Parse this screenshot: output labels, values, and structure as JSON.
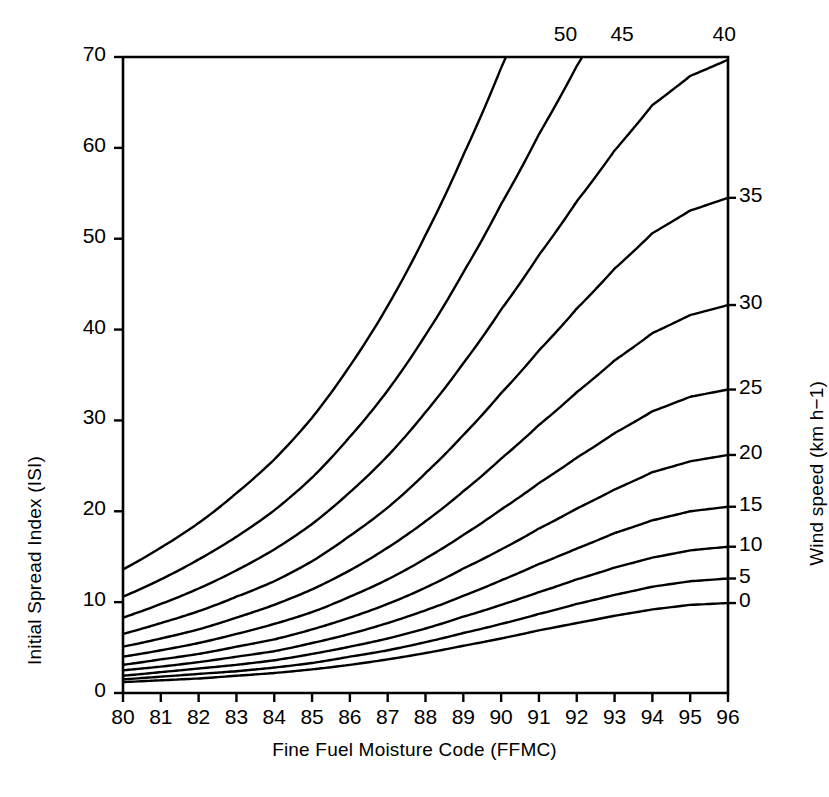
{
  "chart_data": {
    "type": "line",
    "title": "",
    "xlabel": "Fine Fuel Moisture Code (FFMC)",
    "ylabel": "Initial Spread Index (ISI)",
    "y2label": "Wind speed (km h−1)",
    "xlim": [
      80,
      96
    ],
    "ylim": [
      0,
      70
    ],
    "grid": false,
    "legend_position": "curve-end-labels",
    "xticks": [
      "80",
      "81",
      "82",
      "83",
      "84",
      "85",
      "86",
      "87",
      "88",
      "89",
      "90",
      "91",
      "92",
      "93",
      "94",
      "95",
      "96"
    ],
    "xtick_values": [
      80,
      81,
      82,
      83,
      84,
      85,
      86,
      87,
      88,
      89,
      90,
      91,
      92,
      93,
      94,
      95,
      96
    ],
    "yticks": [
      "0",
      "10",
      "20",
      "30",
      "40",
      "50",
      "60",
      "70"
    ],
    "ytick_values": [
      0,
      10,
      20,
      30,
      40,
      50,
      60,
      70
    ],
    "y2_labels_right": [
      "35",
      "30",
      "25",
      "20",
      "15",
      "10",
      "5",
      "0"
    ],
    "y2_labels_top": [
      "50",
      "45",
      "40"
    ],
    "series_label_unit": "km h−1",
    "x": [
      80,
      81,
      82,
      83,
      84,
      85,
      86,
      87,
      88,
      89,
      90,
      91,
      92,
      93,
      94,
      95,
      96
    ],
    "series": [
      {
        "name": "0",
        "wind": 0,
        "values": [
          1.2,
          1.4,
          1.6,
          1.9,
          2.2,
          2.6,
          3.1,
          3.7,
          4.4,
          5.2,
          6.0,
          6.9,
          7.7,
          8.5,
          9.2,
          9.7,
          9.9
        ]
      },
      {
        "name": "5",
        "wind": 5,
        "values": [
          1.5,
          1.8,
          2.1,
          2.4,
          2.8,
          3.3,
          4.0,
          4.7,
          5.6,
          6.6,
          7.6,
          8.7,
          9.8,
          10.8,
          11.7,
          12.3,
          12.6
        ]
      },
      {
        "name": "10",
        "wind": 10,
        "values": [
          1.9,
          2.3,
          2.7,
          3.1,
          3.6,
          4.3,
          5.1,
          6.0,
          7.1,
          8.4,
          9.7,
          11.1,
          12.5,
          13.8,
          14.9,
          15.7,
          16.1
        ]
      },
      {
        "name": "15",
        "wind": 15,
        "values": [
          2.5,
          2.9,
          3.4,
          4.0,
          4.6,
          5.5,
          6.5,
          7.7,
          9.1,
          10.7,
          12.4,
          14.2,
          15.9,
          17.6,
          19.0,
          20.0,
          20.5
        ]
      },
      {
        "name": "20",
        "wind": 20,
        "values": [
          3.1,
          3.7,
          4.3,
          5.1,
          5.9,
          7.0,
          8.3,
          9.8,
          11.6,
          13.7,
          15.8,
          18.1,
          20.3,
          22.4,
          24.3,
          25.5,
          26.2
        ]
      },
      {
        "name": "25",
        "wind": 25,
        "values": [
          4.0,
          4.7,
          5.5,
          6.5,
          7.6,
          8.9,
          10.6,
          12.5,
          14.8,
          17.4,
          20.2,
          23.1,
          25.9,
          28.6,
          31.0,
          32.6,
          33.4
        ]
      },
      {
        "name": "30",
        "wind": 30,
        "values": [
          5.1,
          6.0,
          7.0,
          8.3,
          9.7,
          11.4,
          13.5,
          16.0,
          18.9,
          22.2,
          25.8,
          29.5,
          33.1,
          36.6,
          39.6,
          41.6,
          42.7
        ]
      },
      {
        "name": "35",
        "wind": 35,
        "values": [
          6.5,
          7.7,
          9.0,
          10.6,
          12.3,
          14.5,
          17.3,
          20.4,
          24.2,
          28.4,
          33.0,
          37.7,
          42.3,
          46.7,
          50.6,
          53.1,
          54.5
        ]
      },
      {
        "name": "40",
        "wind": 40,
        "values": [
          8.3,
          9.8,
          11.5,
          13.5,
          15.8,
          18.6,
          22.1,
          26.1,
          30.9,
          36.3,
          42.2,
          48.2,
          54.1,
          59.7,
          64.7,
          67.9,
          69.7
        ]
      },
      {
        "name": "45",
        "wind": 45,
        "values": [
          10.6,
          12.5,
          14.7,
          17.2,
          20.1,
          23.7,
          28.2,
          33.3,
          39.4,
          46.3,
          53.8,
          61.5,
          69.0,
          76.2,
          82.6,
          86.7,
          88.9
        ]
      },
      {
        "name": "50",
        "wind": 50,
        "values": [
          13.6,
          16.0,
          18.7,
          22.0,
          25.7,
          30.3,
          36.0,
          42.6,
          50.4,
          59.2,
          68.8,
          78.6,
          88.2,
          97.4,
          105.6,
          110.8,
          113.6
        ]
      }
    ],
    "top_exit_labels": [
      {
        "name": "50",
        "x_at_top": 91.7
      },
      {
        "name": "45",
        "x_at_top": 93.2
      },
      {
        "name": "40",
        "x_at_top": 95.9
      }
    ],
    "right_edge_labels": [
      {
        "name": "35",
        "isi_at_96": 54.5
      },
      {
        "name": "30",
        "isi_at_96": 42.7
      },
      {
        "name": "25",
        "isi_at_96": 33.4
      },
      {
        "name": "20",
        "isi_at_96": 26.2
      },
      {
        "name": "15",
        "isi_at_96": 20.5
      },
      {
        "name": "10",
        "isi_at_96": 16.1
      },
      {
        "name": "5",
        "isi_at_96": 12.6
      },
      {
        "name": "0",
        "isi_at_96": 9.9
      }
    ],
    "line_color": "#000000",
    "background_color": "#ffffff"
  },
  "figure": {
    "axis_color": "#000000",
    "plot_left_px": 123,
    "plot_right_px": 728,
    "plot_top_px": 57,
    "plot_bottom_px": 693
  }
}
